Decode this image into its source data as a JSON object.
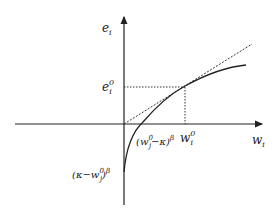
{
  "diagram": {
    "axes": {
      "y_label": "e",
      "y_label_sub": "i",
      "x_label": "w",
      "x_label_sub": "i"
    },
    "point_labels": {
      "e0_main": "e",
      "e0_sup": "0",
      "e0_sub": "i",
      "w0_main": "w",
      "w0_sup": "0",
      "w0_sub": "i"
    },
    "curve_labels": {
      "x_intercept": "(w",
      "x_intercept_sup": "0",
      "x_intercept_sub": "j",
      "x_intercept_rest": "−κ)",
      "x_intercept_exp": "β",
      "y_intercept": "(κ−w",
      "y_intercept_sup": "0",
      "y_intercept_sub": "j",
      "y_intercept_rest": ")",
      "y_intercept_exp": "β"
    },
    "colors": {
      "line": "#222222",
      "background": "#ffffff"
    }
  }
}
